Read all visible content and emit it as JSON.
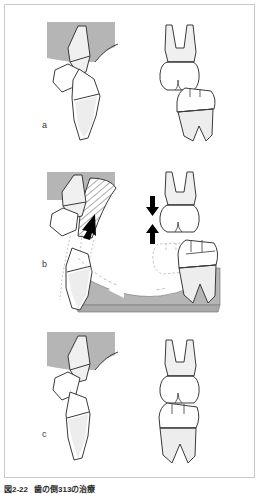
{
  "figure": {
    "kind": "dental-illustration",
    "panel_count": 3,
    "border_color": "#c9c9c9",
    "background_color": "#ffffff",
    "outline_color": "#2b2b2b",
    "bone_fill_color": "#b5b5b5",
    "tooth_fill_color": "#ffffff",
    "tooth_shade_color": "#ededed",
    "ghost_line_color": "#bdbdbd",
    "arrow_solid_color": "#000000",
    "arrow_open_color": "#ffffff"
  },
  "panels": [
    {
      "id": "a",
      "label": "a",
      "description": "Before treatment: mesially tilted lower molar with opposing tooth overerupted",
      "views": [
        {
          "name": "lateral-view",
          "side": "left"
        },
        {
          "name": "frontal-view",
          "side": "right"
        }
      ]
    },
    {
      "id": "b",
      "label": "b",
      "description": "During treatment: uprighting and intrusion forces applied to the tilted molar",
      "views": [
        {
          "name": "lateral-view",
          "side": "left"
        },
        {
          "name": "frontal-view",
          "side": "right"
        }
      ]
    },
    {
      "id": "c",
      "label": "c",
      "description": "After treatment: molar uprighted and occlusal plane levelled",
      "views": [
        {
          "name": "lateral-view",
          "side": "left"
        },
        {
          "name": "frontal-view",
          "side": "right"
        }
      ]
    }
  ],
  "annotations": {
    "arrow_down": {
      "name": "intrusion-arrow-down",
      "direction": "down",
      "style": "solid-black"
    },
    "arrow_up": {
      "name": "eruption-arrow-up",
      "direction": "up",
      "style": "solid-black"
    },
    "arrow_left_open": {
      "name": "mesial-force-arrow",
      "direction": "left",
      "style": "open-white"
    },
    "arrow_uprighting": {
      "name": "uprighting-force-arrow",
      "direction": "down-left",
      "style": "solid-black"
    },
    "hatched_region": {
      "name": "appliance-hatched-region",
      "pattern": "diagonal-hatch"
    },
    "ghost_outlines": {
      "name": "original-position-outline",
      "style": "dotted"
    }
  },
  "caption": {
    "number": "図2-22",
    "text": "歯の倒313の治療"
  }
}
